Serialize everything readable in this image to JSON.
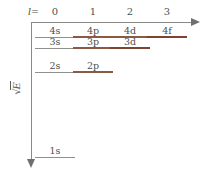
{
  "figure": {
    "axes": {
      "x": {
        "label_prefix": "l",
        "label_equals": "=",
        "ticks": [
          {
            "value": "0",
            "x": 55
          },
          {
            "value": "1",
            "x": 93
          },
          {
            "value": "2",
            "x": 130
          },
          {
            "value": "3",
            "x": 167
          }
        ],
        "arrow": "right-arrow-icon",
        "color": "#8a8a86"
      },
      "y": {
        "label": "√|E|",
        "radical": "√",
        "inner": "E",
        "arrow": "down-arrow-icon",
        "color": "#8a8a86",
        "direction": "downward"
      }
    },
    "colors": {
      "gray_level": "#8f8f8b",
      "brown_level": "#8a5a42",
      "dark_brown_level": "#7a4632",
      "text": "#4f4f4c",
      "axis": "#8a8a86",
      "background": "#ffffff"
    }
  },
  "chart_data": {
    "type": "scatter",
    "xlabel": "l",
    "ylabel": "√|E|",
    "x_ticks": [
      "0",
      "1",
      "2",
      "3"
    ],
    "y_direction": "increasing downward",
    "levels": [
      {
        "label": "4s",
        "l": 0,
        "n": 4,
        "x": 55,
        "y": 38,
        "color": "#8f8f8b",
        "weight": "thin"
      },
      {
        "label": "4p",
        "l": 1,
        "n": 4,
        "x": 93,
        "y": 38,
        "color": "#8a5a42",
        "weight": "thick"
      },
      {
        "label": "4d",
        "l": 2,
        "n": 4,
        "x": 130,
        "y": 38,
        "color": "#8a5a42",
        "weight": "thick"
      },
      {
        "label": "4f",
        "l": 3,
        "n": 4,
        "x": 167,
        "y": 38,
        "color": "#7a4632",
        "weight": "xthick"
      },
      {
        "label": "3s",
        "l": 0,
        "n": 3,
        "x": 55,
        "y": 49,
        "color": "#8f8f8b",
        "weight": "thin"
      },
      {
        "label": "3p",
        "l": 1,
        "n": 3,
        "x": 93,
        "y": 49,
        "color": "#8a5a42",
        "weight": "thick"
      },
      {
        "label": "3d",
        "l": 2,
        "n": 3,
        "x": 130,
        "y": 49,
        "color": "#7a4632",
        "weight": "xthick"
      },
      {
        "label": "2s",
        "l": 0,
        "n": 2,
        "x": 55,
        "y": 73,
        "color": "#8f8f8b",
        "weight": "thin"
      },
      {
        "label": "2p",
        "l": 1,
        "n": 2,
        "x": 93,
        "y": 73,
        "color": "#8a5a42",
        "weight": "thick"
      },
      {
        "label": "1s",
        "l": 0,
        "n": 1,
        "x": 55,
        "y": 158,
        "color": "#8f8f8b",
        "weight": "thin"
      }
    ]
  }
}
